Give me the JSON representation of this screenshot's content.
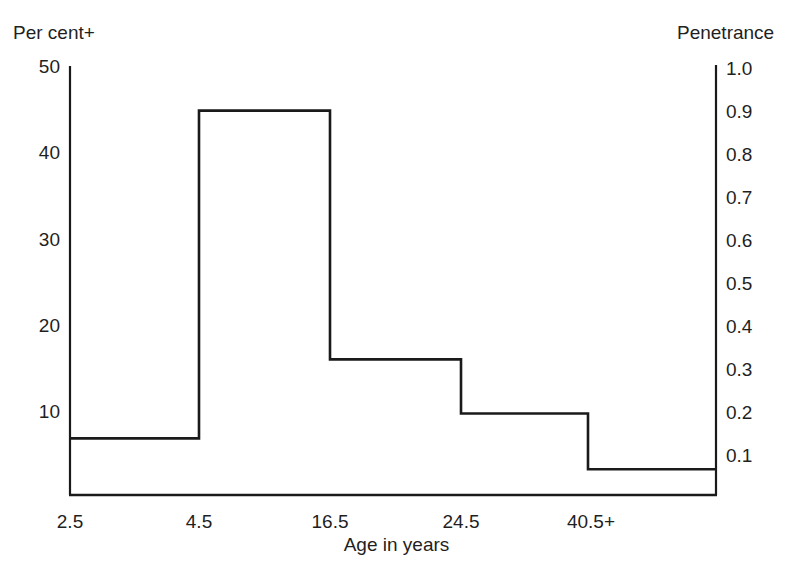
{
  "figure": {
    "left_axis_caption": "Per cent+",
    "right_axis_caption": "Penetrance",
    "xaxis_title": "Age in years"
  },
  "chart_data": {
    "type": "bar",
    "title": "",
    "subtitle": "",
    "xlabel": "Age in years",
    "ylabel": "Per cent+",
    "y2label": "Penetrance",
    "grid": false,
    "legend": "none",
    "style": "step-outline-histogram",
    "categories": [
      "2.5",
      "4.5",
      "16.5",
      "24.5",
      "40.5+"
    ],
    "tick_labels_x": [
      "2.5",
      "4.5",
      "16.5",
      "24.5",
      "40.5+"
    ],
    "values": [
      6.6,
      44.8,
      15.8,
      9.5,
      3.0
    ],
    "values_penetrance": [
      0.13,
      0.9,
      0.32,
      0.19,
      0.06
    ],
    "ylim": [
      0,
      50
    ],
    "y2lim": [
      0.0,
      1.0
    ],
    "yticks": [
      10,
      20,
      30,
      40,
      50
    ],
    "ytick_labels": [
      "10",
      "20",
      "30",
      "40",
      "50"
    ],
    "y2ticks": [
      0.1,
      0.2,
      0.3,
      0.4,
      0.5,
      0.6,
      0.7,
      0.8,
      0.9,
      1.0
    ],
    "y2tick_labels": [
      "0.1",
      "0.2",
      "0.3",
      "0.4",
      "0.5",
      "0.6",
      "0.7",
      "0.8",
      "0.9",
      "1.0"
    ],
    "series": [
      {
        "name": "Per cent affected",
        "values": [
          6.6,
          44.8,
          15.8,
          9.5,
          3.0
        ]
      }
    ],
    "line_color": "#1a1a1a",
    "background_color": "#ffffff"
  }
}
